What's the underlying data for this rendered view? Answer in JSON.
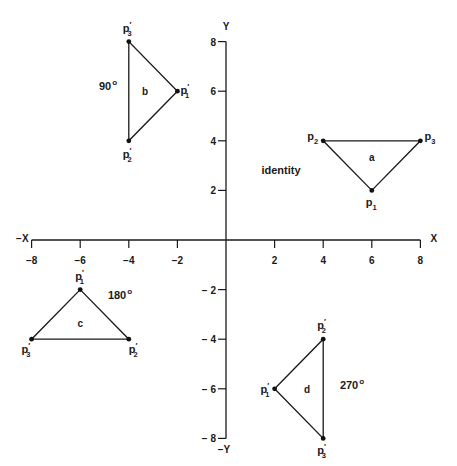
{
  "chart_data": {
    "type": "scatter",
    "title": "",
    "xlabel": "X",
    "xlabel_neg": "-X",
    "ylabel": "Y",
    "ylabel_neg": "-Y",
    "xlim": [
      -8,
      8
    ],
    "ylim": [
      -8,
      8
    ],
    "grid": false,
    "x_ticks": [
      -8,
      -6,
      -4,
      -2,
      2,
      4,
      6,
      8
    ],
    "x_tick_labels": [
      "-8",
      "-6",
      "-4",
      "-2",
      "2",
      "4",
      "6",
      "8"
    ],
    "y_ticks": [
      8,
      6,
      4,
      2,
      -2,
      -4,
      -6,
      -8
    ],
    "y_tick_labels": [
      "8",
      "6",
      "4",
      "2",
      "-2",
      "-4",
      "-6",
      "-8"
    ],
    "series": [
      {
        "name": "a",
        "annotation": "identity",
        "points": [
          {
            "label": "p",
            "sub": "1",
            "prime": false,
            "x": 6,
            "y": 2
          },
          {
            "label": "p",
            "sub": "2",
            "prime": false,
            "x": 4,
            "y": 4
          },
          {
            "label": "p",
            "sub": "3",
            "prime": false,
            "x": 8,
            "y": 4
          }
        ]
      },
      {
        "name": "b",
        "annotation": "90",
        "annotation_suffix": "o",
        "points": [
          {
            "label": "p",
            "sub": "1",
            "prime": true,
            "x": -2,
            "y": 6
          },
          {
            "label": "p",
            "sub": "2",
            "prime": true,
            "x": -4,
            "y": 4
          },
          {
            "label": "p",
            "sub": "3",
            "prime": true,
            "x": -4,
            "y": 8
          }
        ]
      },
      {
        "name": "c",
        "annotation": "180",
        "annotation_suffix": "o",
        "points": [
          {
            "label": "p",
            "sub": "1",
            "prime": true,
            "x": -6,
            "y": -2
          },
          {
            "label": "p",
            "sub": "2",
            "prime": true,
            "x": -4,
            "y": -4
          },
          {
            "label": "p",
            "sub": "3",
            "prime": true,
            "x": -8,
            "y": -4
          }
        ]
      },
      {
        "name": "d",
        "annotation": "270",
        "annotation_suffix": "o",
        "points": [
          {
            "label": "p",
            "sub": "1",
            "prime": true,
            "x": 2,
            "y": -6
          },
          {
            "label": "p",
            "sub": "2",
            "prime": true,
            "x": 4,
            "y": -4
          },
          {
            "label": "p",
            "sub": "3",
            "prime": true,
            "x": 4,
            "y": -8
          }
        ]
      }
    ]
  },
  "style": {
    "ink": "#1a1a1a",
    "background": "#ffffff"
  }
}
